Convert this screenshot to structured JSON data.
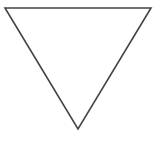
{
  "diagram": {
    "shape": "inverted-triangle",
    "fill": "#ffffff",
    "stroke": "#444444",
    "stroke_width": 1.6,
    "vertices": [
      {
        "x": 5,
        "y": 8
      },
      {
        "x": 151,
        "y": 8
      },
      {
        "x": 78,
        "y": 129
      }
    ]
  }
}
